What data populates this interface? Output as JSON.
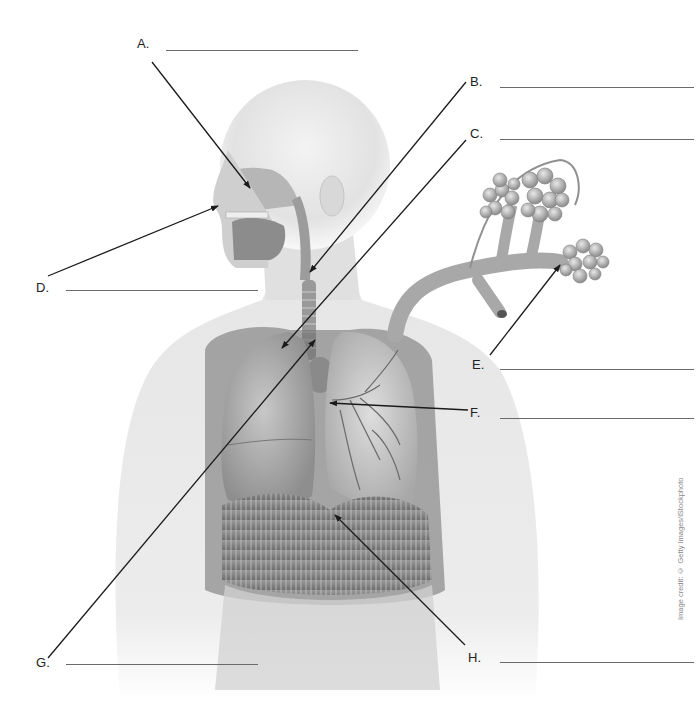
{
  "worksheet": {
    "title": "Respiratory system labeling diagram",
    "image_credit": "Image credit: © Getty Images/iStockphoto"
  },
  "labels": [
    {
      "id": "A",
      "text": "A.",
      "answer": "",
      "label_x": 137,
      "label_y": 36,
      "blank_x1": 166,
      "blank_x2": 358,
      "blank_y": 50,
      "line": [
        152,
        62,
        250,
        188
      ]
    },
    {
      "id": "B",
      "text": "B.",
      "answer": "",
      "label_x": 470,
      "label_y": 74,
      "blank_x1": 500,
      "blank_x2": 694,
      "blank_y": 87,
      "line": [
        466,
        82,
        310,
        272
      ]
    },
    {
      "id": "C",
      "text": "C.",
      "answer": "",
      "label_x": 470,
      "label_y": 126,
      "blank_x1": 500,
      "blank_x2": 694,
      "blank_y": 139,
      "line": [
        466,
        140,
        282,
        348
      ]
    },
    {
      "id": "D",
      "text": "D.",
      "answer": "",
      "label_x": 36,
      "label_y": 280,
      "blank_x1": 66,
      "blank_x2": 258,
      "blank_y": 290,
      "line": [
        48,
        276,
        218,
        206
      ]
    },
    {
      "id": "E",
      "text": "E.",
      "answer": "",
      "label_x": 472,
      "label_y": 357,
      "blank_x1": 500,
      "blank_x2": 694,
      "blank_y": 369,
      "line": [
        490,
        355,
        560,
        265
      ]
    },
    {
      "id": "F",
      "text": "F.",
      "answer": "",
      "label_x": 470,
      "label_y": 405,
      "blank_x1": 500,
      "blank_x2": 694,
      "blank_y": 418,
      "line": [
        468,
        410,
        330,
        403
      ]
    },
    {
      "id": "G",
      "text": "G.",
      "answer": "",
      "label_x": 36,
      "label_y": 655,
      "blank_x1": 66,
      "blank_x2": 258,
      "blank_y": 664,
      "line": [
        48,
        658,
        315,
        340
      ]
    },
    {
      "id": "H",
      "text": "H.",
      "answer": "",
      "label_x": 468,
      "label_y": 650,
      "blank_x1": 500,
      "blank_x2": 694,
      "blank_y": 662,
      "line": [
        465,
        645,
        335,
        515
      ]
    }
  ],
  "figure": {
    "parts_shown": [
      "nasal cavity",
      "nostril",
      "pharynx",
      "larynx",
      "trachea",
      "lungs",
      "bronchi",
      "alveoli",
      "diaphragm"
    ],
    "colors": {
      "skin": "#e4e4e4",
      "organ": "#b8b8b8",
      "organ_dark": "#7a7a7a",
      "line": "#1a1a1a"
    }
  }
}
